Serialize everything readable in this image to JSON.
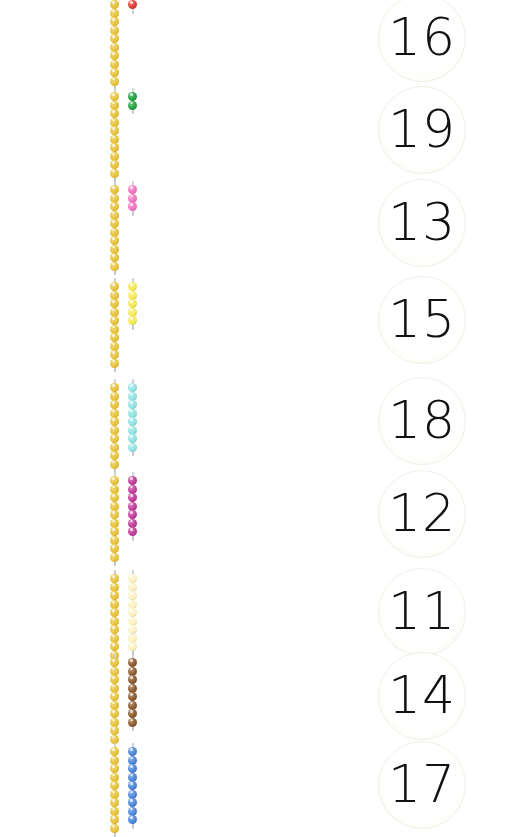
{
  "worksheet": {
    "title": "Teen Number Bead Bar Matching",
    "page_width": 532,
    "page_height": 813,
    "background_color": "#ffffff",
    "ten_bar_color": "#e8c33a",
    "circle_border_color": "#f0efe6",
    "number_color": "#111111"
  },
  "rows": [
    {
      "index": 1,
      "top": -6,
      "ten_bar": {
        "name": "golden-ten-bar",
        "color": "#e8c33a",
        "count": 10
      },
      "unit_bar": {
        "name": "red-unit-bar",
        "color": "#e23b32",
        "count": 1,
        "color_label": "red"
      },
      "number": {
        "value": "16",
        "top": -6
      }
    },
    {
      "index": 2,
      "top": 86,
      "ten_bar": {
        "name": "golden-ten-bar",
        "color": "#e8c33a",
        "count": 10
      },
      "unit_bar": {
        "name": "green-unit-bar",
        "color": "#22a33f",
        "count": 2,
        "color_label": "green"
      },
      "number": {
        "value": "19",
        "top": 86
      }
    },
    {
      "index": 3,
      "top": 179,
      "ten_bar": {
        "name": "golden-ten-bar",
        "color": "#e8c33a",
        "count": 10
      },
      "unit_bar": {
        "name": "pink-unit-bar",
        "color": "#f472c0",
        "count": 3,
        "color_label": "pink"
      },
      "number": {
        "value": "13",
        "top": 179
      }
    },
    {
      "index": 4,
      "top": 276,
      "ten_bar": {
        "name": "golden-ten-bar",
        "color": "#e8c33a",
        "count": 10
      },
      "unit_bar": {
        "name": "yellow-unit-bar",
        "color": "#f6ea55",
        "count": 5,
        "color_label": "yellow"
      },
      "number": {
        "value": "15",
        "top": 276
      }
    },
    {
      "index": 5,
      "top": 377,
      "ten_bar": {
        "name": "golden-ten-bar",
        "color": "#e8c33a",
        "count": 10
      },
      "unit_bar": {
        "name": "light-blue-unit-bar",
        "color": "#8fe3e3",
        "count": 8,
        "color_label": "light blue"
      },
      "number": {
        "value": "18",
        "top": 377
      }
    },
    {
      "index": 6,
      "top": 470,
      "ten_bar": {
        "name": "golden-ten-bar",
        "color": "#e8c33a",
        "count": 10
      },
      "unit_bar": {
        "name": "purple-unit-bar",
        "color": "#c2399b",
        "count": 7,
        "color_label": "purple"
      },
      "number": {
        "value": "12",
        "top": 470
      }
    },
    {
      "index": 7,
      "top": 568,
      "ten_bar": {
        "name": "golden-ten-bar",
        "color": "#e8c33a",
        "count": 10
      },
      "unit_bar": {
        "name": "cream-unit-bar",
        "color": "#fdf2c0",
        "count": 9,
        "color_label": "cream"
      },
      "number": {
        "value": "11",
        "top": 568
      }
    },
    {
      "index": 8,
      "top": 652,
      "ten_bar": {
        "name": "golden-ten-bar",
        "color": "#e8c33a",
        "count": 10
      },
      "unit_bar": {
        "name": "brown-unit-bar",
        "color": "#8c5a2b",
        "count": 8,
        "color_label": "brown"
      },
      "number": {
        "value": "14",
        "top": 652
      }
    },
    {
      "index": 9,
      "top": 741,
      "ten_bar": {
        "name": "golden-ten-bar",
        "color": "#e8c33a",
        "count": 10
      },
      "unit_bar": {
        "name": "blue-unit-bar",
        "color": "#4a86d8",
        "count": 9,
        "color_label": "blue"
      },
      "number": {
        "value": "17",
        "top": 741
      }
    }
  ]
}
